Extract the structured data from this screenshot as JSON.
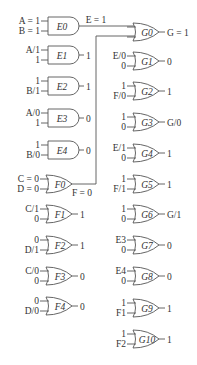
{
  "diagram": {
    "type": "fault-simulation-logic-gates",
    "and_gates": [
      {
        "name": "E0",
        "in1": "A = 1",
        "in2": "B = 1",
        "out": "E = 1",
        "y": 26
      },
      {
        "name": "E1",
        "in1": "A/1",
        "in2": "1",
        "out": "1",
        "y": 55
      },
      {
        "name": "E2",
        "in1": "1",
        "in2": "B/1",
        "out": "1",
        "y": 86
      },
      {
        "name": "E3",
        "in1": "A/0",
        "in2": "1",
        "out": "0",
        "y": 118
      },
      {
        "name": "E4",
        "in1": "1",
        "in2": "B/0",
        "out": "0",
        "y": 150
      }
    ],
    "or_gates_f": [
      {
        "name": "F0",
        "in1": "C = 0",
        "in2": "D = 0",
        "out": "F = 0",
        "y": 184
      },
      {
        "name": "F1",
        "in1": "C/1",
        "in2": "0",
        "out": "1",
        "y": 214
      },
      {
        "name": "F2",
        "in1": "0",
        "in2": "D/1",
        "out": "1",
        "y": 245
      },
      {
        "name": "F3",
        "in1": "C/0",
        "in2": "0",
        "out": "0",
        "y": 276
      },
      {
        "name": "F4",
        "in1": "0",
        "in2": "D/0",
        "out": "0",
        "y": 306
      }
    ],
    "or_gates_g": [
      {
        "name": "G0",
        "in1": "",
        "in2": "",
        "out": "G = 1",
        "y": 32
      },
      {
        "name": "G1",
        "in1": "E/0",
        "in2": "0",
        "out": "0",
        "y": 61
      },
      {
        "name": "G2",
        "in1": "1",
        "in2": "F/0",
        "out": "1",
        "y": 91
      },
      {
        "name": "G3",
        "in1": "1",
        "in2": "0",
        "out": "G/0",
        "y": 122
      },
      {
        "name": "G4",
        "in1": "E/1",
        "in2": "0",
        "out": "1",
        "y": 153
      },
      {
        "name": "G5",
        "in1": "1",
        "in2": "F/1",
        "out": "1",
        "y": 184
      },
      {
        "name": "G6",
        "in1": "1",
        "in2": "0",
        "out": "G/1",
        "y": 214
      },
      {
        "name": "G7",
        "in1": "E3",
        "in2": "0",
        "out": "0",
        "y": 245
      },
      {
        "name": "G8",
        "in1": "E4",
        "in2": "0",
        "out": "0",
        "y": 276
      },
      {
        "name": "G9",
        "in1": "1",
        "in2": "F1",
        "out": "1",
        "y": 308
      },
      {
        "name": "G10",
        "in1": "1",
        "in2": "F2",
        "out": "1",
        "y": 339
      }
    ]
  }
}
